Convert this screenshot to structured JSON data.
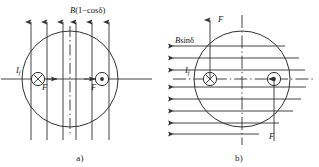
{
  "figure": {
    "width": 319,
    "height": 167,
    "background": "#ffffff",
    "line_color": "#303030",
    "text_color": "#141414"
  },
  "panels": [
    {
      "id": "a",
      "caption": "a)",
      "field_label": "B(1−cosδ)",
      "field_label_parts": {
        "symbol": "B",
        "expression": "(1−cosδ)"
      },
      "field_direction": "up",
      "field_line_count": 6,
      "current_label": "I",
      "current_subscript": "f",
      "force_label_left": "F",
      "force_label_right": "F",
      "force_direction_left": "right",
      "force_direction_right": "right",
      "conductor_left_symbol": "cross-circle-icon",
      "conductor_right_symbol": "dot-circle-icon",
      "centerline": "vertical-dash-dot",
      "axis_line": "horizontal"
    },
    {
      "id": "b",
      "caption": "b)",
      "field_label": "Bsinδ",
      "field_label_parts": {
        "symbol": "B",
        "expression": "sinδ"
      },
      "field_direction": "left",
      "field_line_count": 8,
      "current_label": "I",
      "current_subscript": "f",
      "force_label_top": "F",
      "force_label_bottom": "F",
      "force_direction_top": "up",
      "force_direction_bottom": "down",
      "conductor_left_symbol": "cross-circle-icon",
      "conductor_right_symbol": "dot-circle-icon",
      "centerline": "vertical-and-horizontal-dash-dot",
      "axis_line": "horizontal"
    }
  ]
}
